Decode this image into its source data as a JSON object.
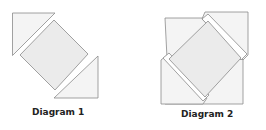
{
  "diagrams": [
    {
      "caption": "Diagram 1"
    },
    {
      "caption": "Diagram 2"
    }
  ],
  "colors": {
    "stroke": "#8a8a8a",
    "triangle_fill": "#f4f4f4",
    "diamond_fill": "#ebebeb",
    "background": "#ffffff",
    "caption": "#222222"
  }
}
